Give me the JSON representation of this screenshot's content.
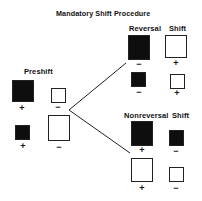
{
  "title": "Mandatory Shift Procedure",
  "preshift": {
    "label": "Preshift",
    "items": [
      {
        "fill": "black",
        "size": "large",
        "sign": "+"
      },
      {
        "fill": "white",
        "size": "small",
        "sign": "−"
      },
      {
        "fill": "black",
        "size": "small",
        "sign": "+"
      },
      {
        "fill": "white",
        "size": "large",
        "sign": "−"
      }
    ]
  },
  "reversal": {
    "label_1": "Reversal",
    "label_2": "Shift",
    "items": [
      {
        "fill": "black",
        "size": "large",
        "sign": "−"
      },
      {
        "fill": "white",
        "size": "large",
        "sign": "+"
      },
      {
        "fill": "black",
        "size": "small",
        "sign": "−"
      },
      {
        "fill": "white",
        "size": "small",
        "sign": "+"
      }
    ]
  },
  "nonreversal": {
    "label_1": "Nonreversal",
    "label_2": "Shift",
    "items": [
      {
        "fill": "black",
        "size": "large",
        "sign": "+"
      },
      {
        "fill": "black",
        "size": "small",
        "sign": "−"
      },
      {
        "fill": "white",
        "size": "large",
        "sign": "+"
      },
      {
        "fill": "white",
        "size": "small",
        "sign": "−"
      }
    ]
  },
  "colors": {
    "fill_dark": "#0e0e0e",
    "fill_light": "#ffffff",
    "stroke": "#222222"
  }
}
